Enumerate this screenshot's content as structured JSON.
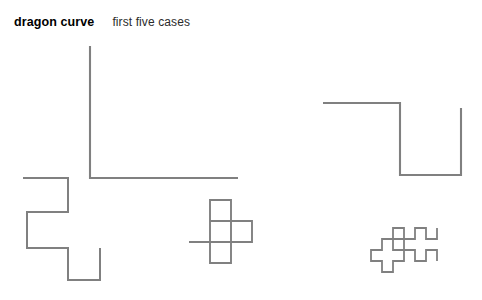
{
  "figure": {
    "title": "dragon curve",
    "subtitle": "first five cases",
    "background_color": "#ffffff",
    "stroke_color": "#808080",
    "width": 482,
    "height": 300
  },
  "chart_data": {
    "type": "line",
    "title": "dragon curve",
    "subtitle": "first five cases",
    "xlabel": "",
    "ylabel": "",
    "grid": false,
    "legend": false,
    "axes_visible": false,
    "series": [
      {
        "name": "case 1",
        "order": 1,
        "segments": 2,
        "unit_px": 132,
        "stroke": "#808080",
        "stroke_width": 2.1,
        "points": "90,46 90,178 238,178"
      },
      {
        "name": "case 2",
        "order": 2,
        "segments": 4,
        "unit_px": 72,
        "stroke": "#808080",
        "stroke_width": 2.1,
        "points": "323,103 400,103 400,175 461,175 461,108"
      },
      {
        "name": "case 3",
        "order": 3,
        "segments": 8,
        "unit_px": 40,
        "stroke": "#808080",
        "stroke_width": 2.0,
        "points": "23,178 68,178 68,212 27,212 27,248 68,248 68,280 100,280 100,248"
      },
      {
        "name": "case 4",
        "order": 4,
        "segments": 16,
        "unit_px": 21,
        "stroke": "#808080",
        "stroke_width": 1.9,
        "points": "231,200 231,221 252,221 252,242 231,242 231,221 210,221 210,200 231,200 231,221 210,221 210,242 231,242 231,263 210,263 210,242 189,242"
      },
      {
        "name": "case 5",
        "order": 5,
        "segments": 32,
        "unit_px": 11,
        "stroke": "#808080",
        "stroke_width": 1.8,
        "points": "437,228 437,239 426,239 426,228 415,228 415,239 404,239 404,228 393,228 393,239 404,239 404,250 393,250 393,239 382,239 382,250 371,250 371,261 382,261 382,272 393,272 393,261 404,261 404,250 415,250 415,261 426,261 426,250 437,250 437,261"
      }
    ]
  }
}
